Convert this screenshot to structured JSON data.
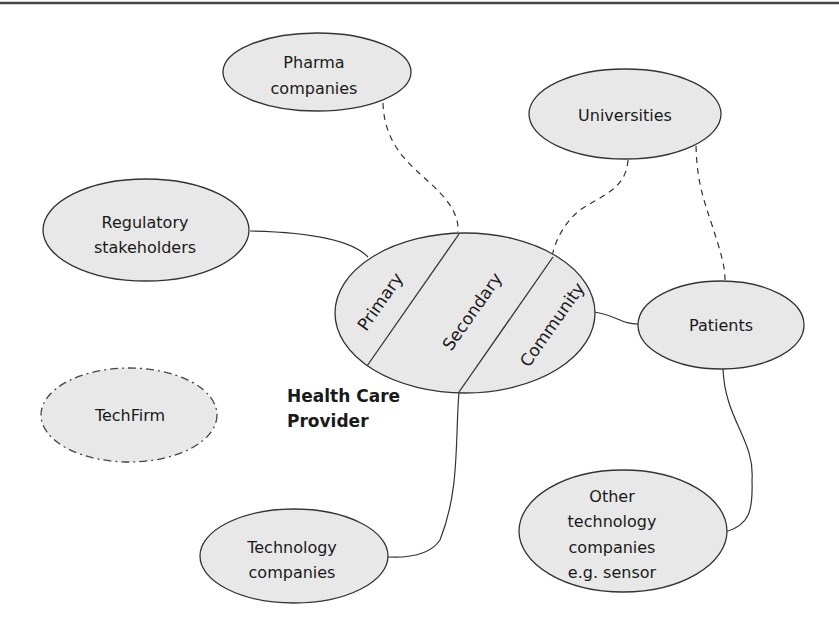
{
  "diagram": {
    "central_node": {
      "caption_line1": "Health Care",
      "caption_line2": "Provider",
      "segments": [
        "Primary",
        "Secondary",
        "Community"
      ]
    },
    "nodes": {
      "pharma": {
        "line1": "Pharma",
        "line2": "companies",
        "connection": "dashed"
      },
      "universities": {
        "line1": "Universities",
        "connection": "dashed"
      },
      "regulatory": {
        "line1": "Regulatory",
        "line2": "stakeholders",
        "connection": "solid"
      },
      "patients": {
        "line1": "Patients",
        "connection": "solid"
      },
      "techfirm": {
        "line1": "TechFirm",
        "border": "dash-dot",
        "connection": "none"
      },
      "technology": {
        "line1": "Technology",
        "line2": "companies",
        "connection": "solid"
      },
      "other_tech": {
        "line1": "Other",
        "line2": "technology",
        "line3": "companies",
        "line4": "e.g. sensor",
        "connection": "solid"
      }
    },
    "edges": [
      {
        "from": "Pharma companies",
        "to": "Health Care Provider",
        "style": "dashed"
      },
      {
        "from": "Universities",
        "to": "Health Care Provider",
        "style": "dashed"
      },
      {
        "from": "Universities",
        "to": "Patients",
        "style": "dashed"
      },
      {
        "from": "Regulatory stakeholders",
        "to": "Health Care Provider",
        "style": "solid"
      },
      {
        "from": "Health Care Provider",
        "to": "Patients",
        "style": "solid"
      },
      {
        "from": "Health Care Provider",
        "to": "Technology companies",
        "style": "solid"
      },
      {
        "from": "Patients",
        "to": "Other technology companies e.g. sensor",
        "style": "solid"
      }
    ],
    "colors": {
      "node_fill": "#e8e8e8",
      "stroke": "#333333",
      "background": "#ffffff"
    }
  }
}
